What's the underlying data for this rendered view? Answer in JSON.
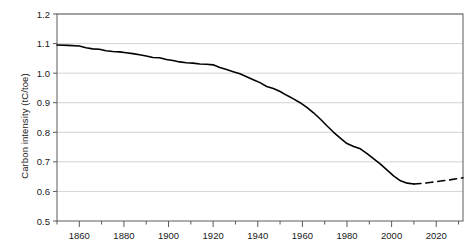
{
  "chart_data": {
    "type": "line",
    "title": "",
    "xlabel": "",
    "ylabel": "Carbon intensity (tC/toe)",
    "xlim": [
      1850,
      2032
    ],
    "ylim": [
      0.5,
      1.2
    ],
    "grid": true,
    "legend_position": "none",
    "y_ticks": [
      "0.5",
      "0.6",
      "0.7",
      "0.8",
      "0.9",
      "1.0",
      "1.1",
      "1.2"
    ],
    "y_tick_values": [
      0.5,
      0.6,
      0.7,
      0.8,
      0.9,
      1.0,
      1.1,
      1.2
    ],
    "x_ticks": [
      "1860",
      "1880",
      "1900",
      "1920",
      "1940",
      "1960",
      "1980",
      "2000",
      "2020"
    ],
    "x_tick_values": [
      1860,
      1880,
      1900,
      1920,
      1940,
      1960,
      1980,
      2000,
      2020
    ],
    "x_minor_tick_values": [
      1850,
      1870,
      1890,
      1910,
      1930,
      1950,
      1970,
      1990,
      2010,
      2030
    ],
    "line_color": "#000000",
    "grid_color": "#c8c8c8",
    "axis_color": "#5a5a5a",
    "series": [
      {
        "name": "Carbon intensity (historical)",
        "style": "solid",
        "x": [
          1850,
          1855,
          1860,
          1863,
          1866,
          1869,
          1872,
          1875,
          1878,
          1881,
          1884,
          1887,
          1890,
          1893,
          1896,
          1899,
          1902,
          1905,
          1908,
          1911,
          1914,
          1917,
          1920,
          1923,
          1926,
          1929,
          1932,
          1935,
          1938,
          1941,
          1944,
          1947,
          1950,
          1953,
          1956,
          1959,
          1962,
          1965,
          1968,
          1971,
          1974,
          1977,
          1980,
          1983,
          1986,
          1989,
          1992,
          1995,
          1998,
          2001,
          2004,
          2007,
          2010
        ],
        "y": [
          1.095,
          1.094,
          1.092,
          1.086,
          1.082,
          1.081,
          1.076,
          1.073,
          1.072,
          1.069,
          1.066,
          1.062,
          1.058,
          1.053,
          1.052,
          1.046,
          1.043,
          1.038,
          1.035,
          1.034,
          1.031,
          1.03,
          1.028,
          1.019,
          1.012,
          1.005,
          0.998,
          0.988,
          0.978,
          0.968,
          0.955,
          0.948,
          0.938,
          0.925,
          0.913,
          0.9,
          0.884,
          0.866,
          0.845,
          0.822,
          0.8,
          0.78,
          0.762,
          0.752,
          0.744,
          0.728,
          0.71,
          0.692,
          0.672,
          0.652,
          0.636,
          0.628,
          0.625
        ]
      },
      {
        "name": "Carbon intensity (projection)",
        "style": "dashed",
        "x": [
          2010,
          2014,
          2018,
          2022,
          2026,
          2030,
          2032
        ],
        "y": [
          0.625,
          0.627,
          0.631,
          0.635,
          0.639,
          0.644,
          0.646
        ]
      }
    ]
  }
}
